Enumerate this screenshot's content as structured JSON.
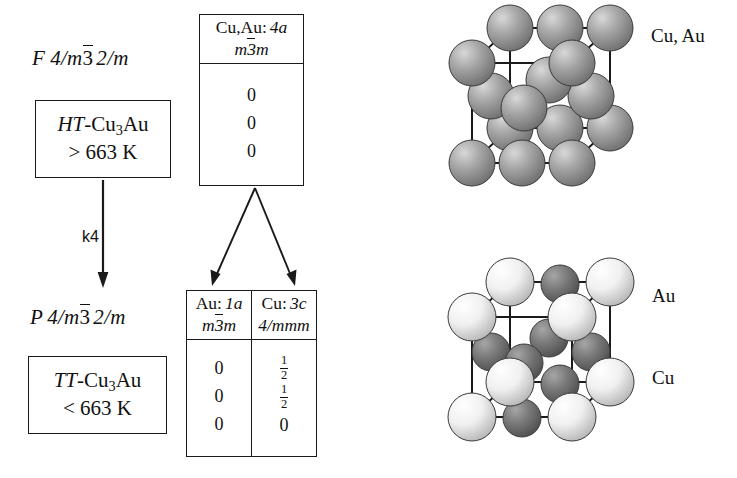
{
  "diagram": {
    "ink_color": "#1a1a1a"
  },
  "branches": {
    "parent": {
      "space_group": {
        "lattice": "F",
        "symbol_pre": "4/m",
        "bar_axis": "3",
        "symbol_post": "2/m"
      },
      "phase_prefix": "HT",
      "phase_formula_a": "-Cu",
      "phase_sub": "3",
      "phase_formula_b": "Au",
      "temperature": "> 663 K"
    },
    "subgroup": {
      "space_group": {
        "lattice": "P",
        "symbol_pre": "4/m",
        "bar_axis": "3",
        "symbol_post": "2/m"
      },
      "phase_prefix": "TT",
      "phase_formula_a": "-Cu",
      "phase_sub": "3",
      "phase_formula_b": "Au",
      "temperature": "< 663 K"
    },
    "transition": {
      "label": "k4"
    }
  },
  "wyckoff_parent": {
    "columns": [
      {
        "atoms": "Cu,Au:",
        "wyckoff": "4a",
        "site_symmetry_pre": "m",
        "site_symmetry_bar": "3",
        "site_symmetry_post": "m",
        "coords": [
          "0",
          "0",
          "0"
        ]
      }
    ]
  },
  "wyckoff_subgroup": {
    "columns": [
      {
        "atoms": "Au:",
        "wyckoff": "1a",
        "site_symmetry_pre": "m",
        "site_symmetry_bar": "3",
        "site_symmetry_post": "m",
        "coords": [
          "0",
          "0",
          "0"
        ],
        "coords_frac": [
          null,
          null,
          null
        ]
      },
      {
        "atoms": "Cu:",
        "wyckoff": "3c",
        "site_symmetry_pre": "4/mmm",
        "site_symmetry_bar": "",
        "site_symmetry_post": "",
        "coords": [
          null,
          null,
          "0"
        ],
        "coords_frac": [
          {
            "num": "1",
            "den": "2"
          },
          {
            "num": "1",
            "den": "2"
          },
          null
        ]
      }
    ]
  },
  "structures": {
    "top": {
      "label": "Cu, Au",
      "description": "face-centred cubic cell, all sites mixed Cu/Au",
      "sphere_color": "#9a9a9a",
      "sphere_highlight": "#d2d2d2"
    },
    "bottom": {
      "label_au": "Au",
      "label_cu": "Cu",
      "description": "ordered Cu3Au cell: Au at corners, Cu at face centres",
      "au_color": "#f2f2f2",
      "au_highlight": "#ffffff",
      "cu_color": "#6f6f6f",
      "cu_highlight": "#9c9c9c"
    }
  }
}
